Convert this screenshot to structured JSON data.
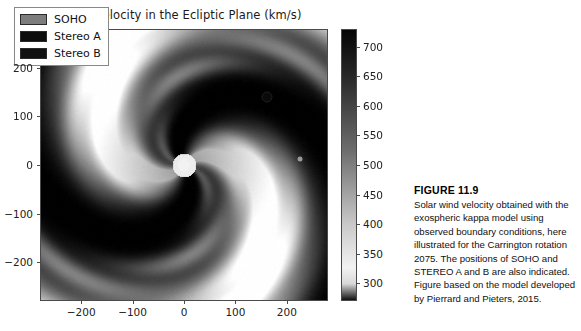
{
  "figure": {
    "title": "Bulk velocity in the Ecliptic Plane (km/s)",
    "legend": [
      {
        "label": "SOHO",
        "color": "#7d7d7d",
        "name": "soho"
      },
      {
        "label": "Stereo A",
        "color": "#0d0d0d",
        "name": "stereo-a"
      },
      {
        "label": "Stereo B",
        "color": "#111111",
        "name": "stereo-b"
      }
    ],
    "markers": [
      {
        "name": "stereo-a",
        "x": 160,
        "y": 143,
        "color": "#0a0a0a"
      },
      {
        "name": "soho",
        "x": 223,
        "y": 15,
        "color": "#9a9a9a"
      }
    ],
    "sun": {
      "name": "sun",
      "x": 0,
      "y": 0,
      "color": "#f2f2f2"
    }
  },
  "caption": {
    "heading": "FIGURE 11.9",
    "body": "Solar wind velocity obtained with the exospheric kappa model using observed boundary conditions, here illustrated for the Carrington rotation 2075. The positions of SOHO and STEREO A and B are also indicated. Figure based on the model developed by Pierrard and Pieters, 2015."
  },
  "chart_data": {
    "type": "heatmap",
    "title": "Bulk velocity in the Ecliptic Plane (km/s)",
    "xlabel": "",
    "ylabel": "",
    "xlim": [
      -280,
      280
    ],
    "ylim": [
      -280,
      280
    ],
    "xticks": [
      -200,
      -100,
      0,
      100,
      200
    ],
    "xticklabels": [
      "−200",
      "−100",
      "0",
      "100",
      "200"
    ],
    "yticks": [
      -200,
      -100,
      0,
      100,
      200
    ],
    "yticklabels": [
      "−200",
      "−100",
      "0",
      "100",
      "200"
    ],
    "grid": false,
    "legend_position": "upper left",
    "colorbar": {
      "label": "",
      "cmin": 270,
      "cmax": 730,
      "ticks": [
        300,
        350,
        400,
        450,
        500,
        550,
        600,
        650,
        700
      ],
      "ticklabels": [
        "300",
        "350",
        "400",
        "450",
        "500",
        "550",
        "600",
        "650",
        "700"
      ],
      "colormap": "gray_reversed",
      "low_color": "#f2f2f2",
      "high_color": "#050505"
    },
    "annotations": [
      {
        "text": "Sun",
        "x": 0,
        "y": 0
      },
      {
        "text": "Stereo A",
        "x": 160,
        "y": 143
      },
      {
        "text": "SOHO",
        "x": 223,
        "y": 15
      }
    ]
  }
}
